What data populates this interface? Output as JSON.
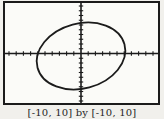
{
  "figure": {
    "caption": "[-10, 10] by [-10, 10]"
  },
  "chart_data": {
    "type": "line",
    "curve": "ellipse",
    "title": "",
    "xlabel": "",
    "ylabel": "",
    "legend": false,
    "grid": false,
    "window": {
      "xmin": -10,
      "xmax": 10,
      "xscl": 1,
      "ymin": -10,
      "ymax": 10,
      "yscl": 1
    },
    "caption": "[-10, 10] by [-10, 10]",
    "series": [
      {
        "name": "rotated-ellipse",
        "shape": "ellipse",
        "center": [
          0,
          0
        ],
        "x_extent": [
          -6,
          6
        ],
        "y_extent": [
          -7,
          7
        ],
        "tilt": "major axis tilted counterclockwise ~15 deg (lower-left to upper-right)"
      }
    ]
  },
  "render": {
    "plot": {
      "w": 153,
      "h": 100
    },
    "axes": {
      "cx": 76,
      "cy": 50.5,
      "x_tick_step": 7.2,
      "y_tick_step": 4.75,
      "x_ticks_each_side": 10,
      "y_ticks_each_side": 10,
      "tick_half": 2.2
    },
    "ellipse": {
      "cx": 76,
      "cy": 53,
      "rx": 45,
      "ry": 32.5,
      "transform": "rotate(-15 76 53)"
    },
    "colors": {
      "ink": "#1b1b1b",
      "paper": "#fbfbf8",
      "page_bg": "#f1f0ec"
    }
  }
}
